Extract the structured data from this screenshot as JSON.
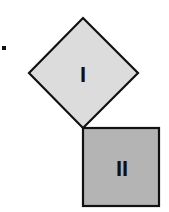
{
  "diagram": {
    "bullet": {
      "x": 3,
      "y": 48,
      "size": 4,
      "color": "#111111"
    },
    "shapes": [
      {
        "id": "square-I",
        "label": "I",
        "rotation_deg": 45,
        "fill": "#dcdcdc",
        "stroke": "#111111",
        "points": "83,18 138,73 83,128 29,73",
        "label_x": 83,
        "label_y": 82
      },
      {
        "id": "square-II",
        "label": "II",
        "rotation_deg": 0,
        "fill": "#b4b4b4",
        "stroke": "#111111",
        "x": 83,
        "y": 128,
        "width": 76,
        "height": 78,
        "label_x": 122,
        "label_y": 176
      }
    ]
  }
}
